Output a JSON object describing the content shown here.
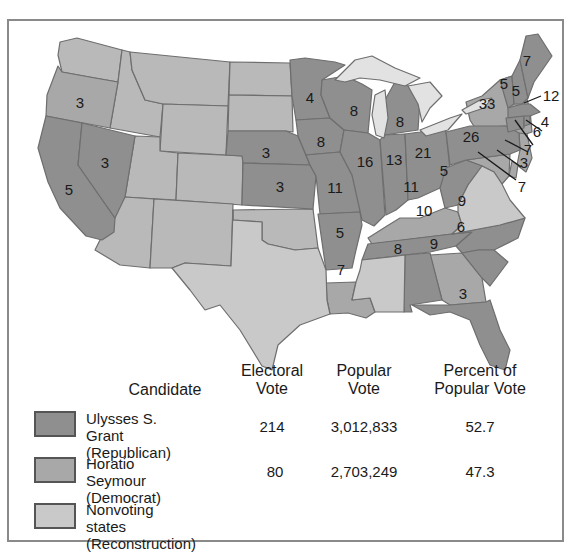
{
  "colors": {
    "republican": "#8f8f8f",
    "democrat": "#a8a8a8",
    "nonvoting": "#c9c9c9",
    "territory": "#b9b9b9",
    "lakes": "#e2e2e2",
    "border": "#6e6e6e"
  },
  "map": {
    "labels": {
      "oregon": "3",
      "nevada": "3",
      "california": "5",
      "nebraska": "3",
      "kansas": "3",
      "minnesota": "4",
      "iowa": "8",
      "missouri": "11",
      "arkansas": "5",
      "louisiana": "7",
      "wisconsin": "8",
      "illinois": "16",
      "michigan": "8",
      "indiana": "13",
      "ohio": "21",
      "kentucky": "11",
      "tennessee": "10",
      "alabama": "8",
      "georgia": "9",
      "florida": "3",
      "west_virginia": "5",
      "north_carolina": "9",
      "south_carolina": "6",
      "pennsylvania": "26",
      "new_york": "33",
      "vermont": "5",
      "new_hampshire": "5",
      "maine": "7",
      "massachusetts": "12",
      "rhode_island": "4",
      "connecticut": "6",
      "new_jersey": "7",
      "delaware": "3",
      "maryland": "7"
    }
  },
  "table": {
    "headers": {
      "candidate": "Candidate",
      "electoral_1": "Electoral",
      "electoral_2": "Vote",
      "popular_1": "Popular",
      "popular_2": "Vote",
      "percent_1": "Percent of",
      "percent_2": "Popular Vote"
    },
    "rows": [
      {
        "name": "Ulysses S. Grant",
        "party": "(Republican)",
        "electoral": "214",
        "popular": "3,012,833",
        "percent": "52.7"
      },
      {
        "name": "Horatio Seymour",
        "party": "(Democrat)",
        "electoral": "80",
        "popular": "2,703,249",
        "percent": "47.3"
      },
      {
        "name": "Nonvoting states",
        "party": "(Reconstruction)",
        "electoral": "",
        "popular": "",
        "percent": ""
      }
    ]
  }
}
